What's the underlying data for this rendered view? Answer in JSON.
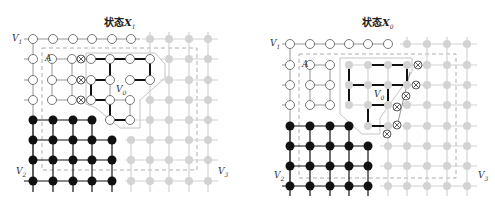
{
  "panels": [
    {
      "id": "left",
      "title_prefix": "状态",
      "title_var": "X",
      "title_sub": "1",
      "labels": {
        "v1": "V",
        "v1_sub": "1",
        "v2": "V",
        "v2_sub": "2",
        "v3": "V",
        "v3_sub": "3",
        "v0": "V",
        "v0_sub": "0",
        "a": "A"
      }
    },
    {
      "id": "right",
      "title_prefix": "状态",
      "title_var": "X",
      "title_sub": "0",
      "labels": {
        "v1": "V",
        "v1_sub": "1",
        "v2": "V",
        "v2_sub": "2",
        "v3": "V",
        "v3_sub": "3",
        "v0": "V",
        "v0_sub": "0",
        "a": "A"
      }
    }
  ],
  "legend_colors": {
    "white_node": "#ffffff",
    "black_node": "#111111",
    "gray_node": "#d0d0d0",
    "bold_edge": "#111111",
    "thin_edge": "#9a9a9a",
    "gray_edge": "#cfcfcf",
    "dashed_box": "#999999"
  }
}
